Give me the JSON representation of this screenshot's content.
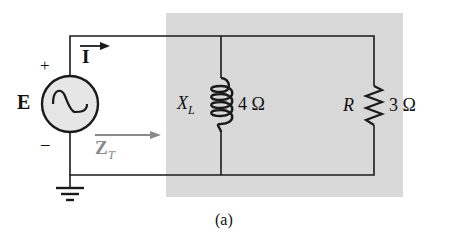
{
  "figure": {
    "caption": "(a)",
    "colors": {
      "shaded_region": "#d9d9d9",
      "wire": "#1a1a1a",
      "source_fill": "#e6e6e6",
      "zt_arrow": "#8a8a8a"
    }
  },
  "source": {
    "label": "E",
    "plus": "+",
    "minus": "–"
  },
  "current": {
    "label": "I"
  },
  "impedance": {
    "label": "Z",
    "subscript": "T"
  },
  "inductor": {
    "name": "X",
    "subscript": "L",
    "value": "4 Ω"
  },
  "resistor": {
    "name": "R",
    "value": "3 Ω"
  }
}
